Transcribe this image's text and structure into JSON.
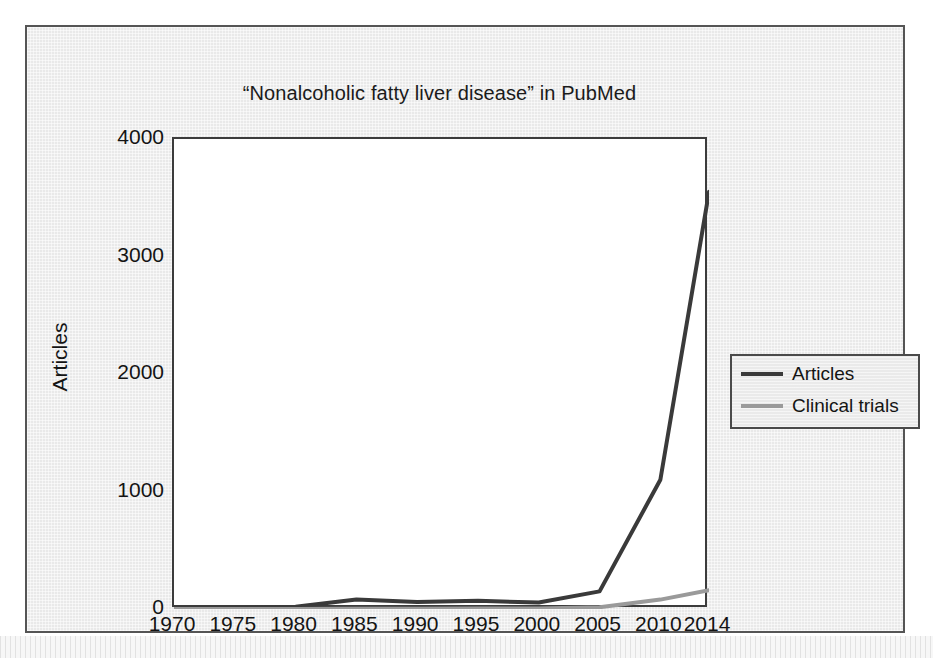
{
  "figure": {
    "title": "“Nonalcoholic fatty liver disease” in PubMed",
    "background_color": "#e9e9e9",
    "plot_background_color": "#ffffff",
    "frame_color": "#555555"
  },
  "chart_data": {
    "type": "line",
    "title": "“Nonalcoholic fatty liver disease” in PubMed",
    "xlabel": "",
    "ylabel": "Articles",
    "x": [
      1970,
      1975,
      1980,
      1985,
      1990,
      1995,
      2000,
      2005,
      2010,
      2014
    ],
    "categories": [
      "1970",
      "1975",
      "1980",
      "1985",
      "1990",
      "1995",
      "2000",
      "2005",
      "2010",
      "2014"
    ],
    "series": [
      {
        "name": "Articles",
        "color": "#3a3a3a",
        "line_width": 4,
        "values": [
          2,
          5,
          20,
          80,
          60,
          70,
          55,
          150,
          1100,
          3550
        ]
      },
      {
        "name": "Clinical trials",
        "color": "#9a9a9a",
        "line_width": 4,
        "values": [
          0,
          0,
          1,
          2,
          3,
          4,
          5,
          15,
          80,
          160
        ]
      }
    ],
    "ylim": [
      0,
      4000
    ],
    "yticks": [
      0,
      1000,
      2000,
      3000,
      4000
    ],
    "ytick_labels": [
      "0",
      "1000",
      "2000",
      "3000",
      "4000"
    ],
    "xlim": [
      1970,
      2014
    ],
    "xticks": [
      1970,
      1975,
      1980,
      1985,
      1990,
      1995,
      2000,
      2005,
      2010,
      2014
    ],
    "xtick_labels": [
      "1970",
      "1975",
      "1980",
      "1985",
      "1990",
      "1995",
      "2000",
      "2005",
      "2010",
      "2014"
    ],
    "grid": false,
    "legend_position": "right-outside",
    "legend_entries": [
      "Articles",
      "Clinical trials"
    ]
  }
}
